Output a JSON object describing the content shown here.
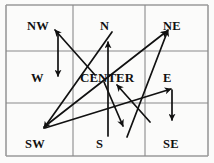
{
  "figure": {
    "background_color": "#fbfbfa",
    "grid": {
      "line_color": "#8a8a8a",
      "border_color": "#9a9a9a",
      "rows": 3,
      "columns": 3,
      "left": 6,
      "top": 5,
      "right": 208,
      "bottom": 156,
      "vertical_lines": [
        73,
        145
      ],
      "horizontal_lines": [
        51,
        103
      ]
    },
    "arrow_color": "#111111",
    "cells": [
      {
        "id": "nw",
        "label": "NW",
        "row": 0,
        "col": 0,
        "x": 27,
        "y": 20
      },
      {
        "id": "n",
        "label": "N",
        "row": 0,
        "col": 1,
        "x": 100,
        "y": 20
      },
      {
        "id": "ne",
        "label": "NE",
        "row": 0,
        "col": 2,
        "x": 163,
        "y": 20
      },
      {
        "id": "w",
        "label": "W",
        "row": 1,
        "col": 0,
        "x": 31,
        "y": 72
      },
      {
        "id": "center",
        "label": "CENTER",
        "row": 1,
        "col": 1,
        "x": 80,
        "y": 71
      },
      {
        "id": "e",
        "label": "E",
        "row": 1,
        "col": 2,
        "x": 163,
        "y": 72
      },
      {
        "id": "sw",
        "label": "SW",
        "row": 2,
        "col": 0,
        "x": 25,
        "y": 138
      },
      {
        "id": "s",
        "label": "S",
        "row": 2,
        "col": 1,
        "x": 96,
        "y": 138
      },
      {
        "id": "se",
        "label": "SE",
        "row": 2,
        "col": 2,
        "x": 163,
        "y": 138
      }
    ],
    "arrows": [
      {
        "id": "arrow-center-to-nw",
        "from": [
          95,
          75
        ],
        "to": [
          55,
          30
        ]
      },
      {
        "id": "arrow-nw-to-w",
        "from": [
          58,
          32
        ],
        "to": [
          58,
          76
        ]
      },
      {
        "id": "arrow-n-to-sw",
        "from": [
          112,
          32
        ],
        "to": [
          44,
          128
        ]
      },
      {
        "id": "arrow-s-to-n",
        "from": [
          108,
          136
        ],
        "to": [
          108,
          42
        ]
      },
      {
        "id": "arrow-sw-to-ne",
        "from": [
          44,
          127
        ],
        "to": [
          167,
          31
        ]
      },
      {
        "id": "arrow-se-to-ne",
        "from": [
          127,
          137
        ],
        "to": [
          168,
          30
        ]
      },
      {
        "id": "arrow-sw-to-e",
        "from": [
          45,
          128
        ],
        "to": [
          171,
          89
        ]
      },
      {
        "id": "arrow-se-to-center",
        "from": [
          150,
          122
        ],
        "to": [
          117,
          85
        ]
      },
      {
        "id": "arrow-e-to-se",
        "from": [
          172,
          90
        ],
        "to": [
          172,
          120
        ]
      },
      {
        "id": "arrow-center-to-s",
        "from": [
          104,
          82
        ],
        "to": [
          123,
          126
        ]
      }
    ]
  }
}
